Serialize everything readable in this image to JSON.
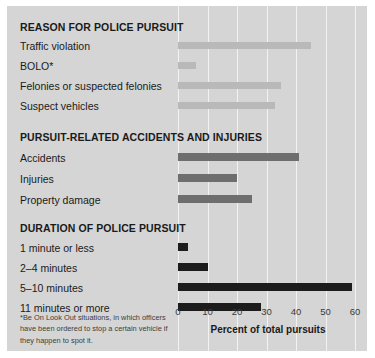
{
  "chart_data": {
    "type": "bar",
    "orientation": "horizontal",
    "title": "",
    "xlabel": "Percent of total pursuits",
    "ylabel": "",
    "xlim": [
      0,
      60
    ],
    "xticks": [
      0,
      10,
      20,
      30,
      40,
      50,
      60
    ],
    "grid": true,
    "legend": "none",
    "groups": [
      {
        "name": "REASON FOR POLICE PURSUIT",
        "color": "#b9b9b9",
        "categories": [
          "Traffic violation",
          "BOLO*",
          "Felonies or suspected felonies",
          "Suspect vehicles"
        ],
        "values": [
          45,
          6,
          35,
          33
        ]
      },
      {
        "name": "PURSUIT-RELATED ACCIDENTS AND INJURIES",
        "color": "#6e6e6e",
        "categories": [
          "Accidents",
          "Injuries",
          "Property damage"
        ],
        "values": [
          41,
          20,
          25
        ]
      },
      {
        "name": "DURATION OF POLICE PURSUIT",
        "color": "#1c1c1c",
        "categories": [
          "1 minute or less",
          "2–4 minutes",
          "5–10 minutes",
          "11 minutes or more"
        ],
        "values": [
          3.5,
          10,
          59,
          28
        ]
      }
    ],
    "footnote": "*Be On Look Out situations, in which officers have been ordered to stop a certain vehicle if they happen to spot it."
  },
  "sections": {
    "reason": {
      "title": "REASON FOR POLICE PURSUIT",
      "rows": [
        {
          "label": "Traffic violation",
          "value": 45
        },
        {
          "label": "BOLO*",
          "value": 6
        },
        {
          "label": "Felonies or suspected felonies",
          "value": 35
        },
        {
          "label": "Suspect vehicles",
          "value": 33
        }
      ]
    },
    "accidents": {
      "title": "PURSUIT-RELATED ACCIDENTS AND INJURIES",
      "rows": [
        {
          "label": "Accidents",
          "value": 41
        },
        {
          "label": "Injuries",
          "value": 20
        },
        {
          "label": "Property damage",
          "value": 25
        }
      ]
    },
    "duration": {
      "title": "DURATION OF POLICE PURSUIT",
      "rows": [
        {
          "label": "1 minute or less",
          "value": 3.5
        },
        {
          "label": "2–4 minutes",
          "value": 10
        },
        {
          "label": "5–10 minutes",
          "value": 59
        },
        {
          "label": "11 minutes or more",
          "value": 28
        }
      ]
    }
  },
  "axis": {
    "title": "Percent of total pursuits",
    "ticks": [
      "0",
      "10",
      "20",
      "30",
      "40",
      "50",
      "60"
    ]
  },
  "footnote": {
    "text": "*Be On Look Out situations, in which officers have been ordered to stop a certain vehicle if they happen to spot it."
  },
  "colors": {
    "panel_background": "#d5d5d5",
    "gridline": "#f2f2f2",
    "group1_bar": "#b9b9b9",
    "group2_bar": "#6e6e6e",
    "group3_bar": "#1c1c1c",
    "text": "#1a1a1a"
  }
}
